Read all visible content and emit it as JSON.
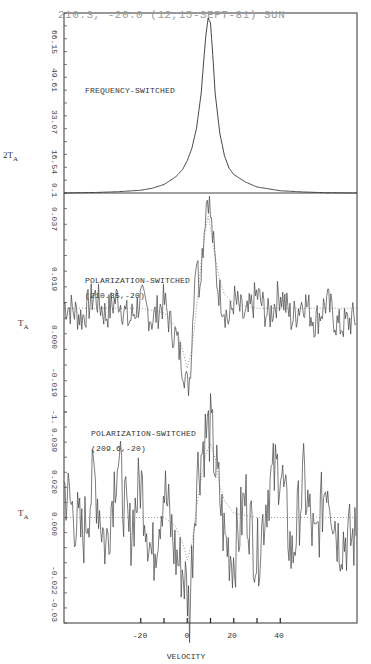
{
  "header": {
    "title": "210.3, -20.0 (12,15-SEPT-81) SUN"
  },
  "panels": [
    {
      "label": "FREQUENCY-SWITCHED",
      "sublabel": "",
      "ylabel": "2T",
      "ylabel_sub": "A",
      "yticks": [
        "66.15",
        "49.61",
        "33.07",
        "16.54",
        "0.1"
      ]
    },
    {
      "label": "POLARIZATION-SWITCHED",
      "sublabel": "(210.35,-20)",
      "ylabel": "T",
      "ylabel_sub": "A",
      "yticks": [
        "0.037",
        "0.019",
        "0.000",
        "-0.019",
        "-1."
      ]
    },
    {
      "label": "POLARIZATION-SWITCHED",
      "sublabel": "(209.6,-20)",
      "ylabel": "T",
      "ylabel_sub": "A",
      "yticks": [
        "0.039",
        "0.020",
        "0.000",
        "-0.022",
        "-0.03"
      ]
    }
  ],
  "xaxis": {
    "label": "VELOCITY",
    "tick_labels": [
      "-20",
      "0",
      "20",
      "40"
    ]
  },
  "chart_data": [
    {
      "type": "line",
      "title": "FREQUENCY-SWITCHED",
      "header": "210.3, -20.0 (12,15-SEPT-81) SUN",
      "xlabel": "VELOCITY",
      "ylabel": "2T_A",
      "x_ticks": [
        -20,
        -10,
        0,
        10,
        20,
        30,
        40
      ],
      "x_tick_labels": [
        "-20",
        "0",
        "20",
        "40"
      ],
      "xlim": [
        -53,
        73
      ],
      "y_ticks": [
        0.1,
        16.54,
        33.07,
        49.61,
        66.15
      ],
      "ylim": [
        0.1,
        72
      ],
      "grid": false,
      "series": [
        {
          "name": "frequency-switched spectrum",
          "x": [
            -53,
            -40,
            -30,
            -20,
            -15,
            -10,
            -5,
            -2,
            0,
            2,
            4,
            6,
            7,
            8,
            9,
            10,
            11,
            12,
            14,
            16,
            18,
            20,
            25,
            30,
            40,
            50,
            60,
            73
          ],
          "y": [
            0.1,
            0.3,
            0.6,
            1.2,
            2.0,
            3.5,
            6.5,
            9.5,
            13,
            18,
            26,
            40,
            52,
            63,
            70,
            68,
            55,
            40,
            24,
            15,
            10,
            7.5,
            4.5,
            2.5,
            1.0,
            0.5,
            0.2,
            0.1
          ]
        }
      ]
    },
    {
      "type": "line",
      "title": "POLARIZATION-SWITCHED (210.35,-20)",
      "xlabel": "VELOCITY",
      "ylabel": "T_A",
      "y_ticks": [
        -0.038,
        -0.019,
        0.0,
        0.019,
        0.037
      ],
      "y_tick_labels": [
        "-1.",
        "-0.019",
        "0.000",
        "0.019",
        "0.037"
      ],
      "ylim": [
        -0.045,
        0.05
      ],
      "series": [
        {
          "name": "observed (noisy)",
          "x": [
            -53,
            -45,
            -40,
            -35,
            -30,
            -25,
            -20,
            -15,
            -10,
            -7,
            -5,
            -3,
            -1,
            0,
            1,
            2,
            3,
            4,
            5,
            6,
            7,
            8,
            9,
            10,
            11,
            12,
            13,
            15,
            18,
            20,
            25,
            30,
            35,
            40,
            45,
            50,
            55,
            60,
            65,
            73
          ],
          "y": [
            0.002,
            -0.004,
            0.006,
            -0.003,
            0.005,
            -0.006,
            0.004,
            -0.005,
            0.003,
            -0.008,
            -0.012,
            -0.02,
            -0.028,
            -0.035,
            -0.03,
            -0.015,
            0.012,
            0.025,
            0.01,
            0.02,
            0.03,
            0.045,
            0.05,
            0.04,
            0.03,
            0.02,
            0.01,
            0.003,
            -0.006,
            0.004,
            -0.005,
            0.006,
            -0.004,
            0.007,
            -0.005,
            0.004,
            -0.006,
            0.003,
            -0.008,
            -0.004
          ]
        },
        {
          "name": "model (dotted)",
          "x": [
            -53,
            -20,
            -10,
            -5,
            -2,
            0,
            2,
            4,
            6,
            8,
            9,
            10,
            12,
            14,
            16,
            20,
            30,
            73
          ],
          "y": [
            0.0,
            0.0,
            -0.002,
            -0.008,
            -0.018,
            -0.026,
            -0.018,
            0.0,
            0.02,
            0.035,
            0.04,
            0.035,
            0.022,
            0.012,
            0.006,
            0.002,
            0.0,
            0.0
          ]
        }
      ]
    },
    {
      "type": "line",
      "title": "POLARIZATION-SWITCHED (209.6,-20)",
      "xlabel": "VELOCITY",
      "ylabel": "T_A",
      "y_ticks": [
        -0.039,
        -0.02,
        0.0,
        0.02,
        0.039
      ],
      "y_tick_labels": [
        "-0.03",
        "-0.022",
        "0.000",
        "0.020",
        "0.039"
      ],
      "ylim": [
        -0.05,
        0.05
      ],
      "series": [
        {
          "name": "observed (noisy)",
          "x": [
            -53,
            -45,
            -40,
            -35,
            -30,
            -25,
            -20,
            -15,
            -10,
            -5,
            -2,
            0,
            1,
            2,
            4,
            6,
            8,
            10,
            11,
            12,
            14,
            16,
            20,
            25,
            30,
            35,
            40,
            45,
            50,
            55,
            60,
            65,
            73
          ],
          "y": [
            0.015,
            -0.01,
            0.02,
            -0.015,
            0.03,
            -0.01,
            0.018,
            -0.02,
            0.015,
            -0.018,
            -0.025,
            -0.035,
            -0.045,
            -0.02,
            0.02,
            0.03,
            0.04,
            0.042,
            0.035,
            0.025,
            0.01,
            -0.01,
            -0.02,
            0.01,
            -0.02,
            0.015,
            0.025,
            -0.02,
            0.018,
            -0.015,
            0.02,
            -0.01,
            -0.01
          ]
        },
        {
          "name": "model (dotted)",
          "x": [
            -53,
            -10,
            -5,
            -2,
            0,
            2,
            4,
            6,
            8,
            10,
            12,
            14,
            16,
            20,
            30,
            73
          ],
          "y": [
            0.0,
            0.0,
            -0.004,
            -0.012,
            -0.02,
            -0.012,
            0.005,
            0.018,
            0.03,
            0.035,
            0.028,
            0.015,
            0.008,
            0.002,
            0.0,
            0.0
          ]
        }
      ]
    }
  ]
}
